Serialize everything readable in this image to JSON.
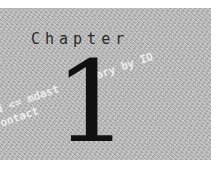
{
  "chapter": {
    "label": "Chapter",
    "number": "1"
  },
  "watermark": {
    "line1": "d <= mdast      ary by IO",
    "line2": "ontact"
  },
  "colors": {
    "panel": "#b8b8b8",
    "text": "#2a2a2a",
    "numeral": "#111111"
  }
}
